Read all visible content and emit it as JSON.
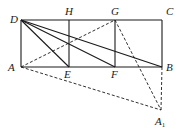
{
  "diagram": {
    "type": "geometry",
    "points": [
      {
        "id": "D",
        "label": "D"
      },
      {
        "id": "H",
        "label": "H"
      },
      {
        "id": "G",
        "label": "G"
      },
      {
        "id": "C",
        "label": "C"
      },
      {
        "id": "A",
        "label": "A"
      },
      {
        "id": "E",
        "label": "E"
      },
      {
        "id": "F",
        "label": "F"
      },
      {
        "id": "B",
        "label": "B"
      },
      {
        "id": "A1",
        "label": "A",
        "subscript": "1"
      }
    ],
    "solid_segments": [
      [
        "D",
        "C"
      ],
      [
        "A",
        "B"
      ],
      [
        "D",
        "A"
      ],
      [
        "C",
        "B"
      ],
      [
        "H",
        "E"
      ],
      [
        "G",
        "F"
      ],
      [
        "D",
        "E"
      ],
      [
        "D",
        "F"
      ],
      [
        "D",
        "B"
      ]
    ],
    "dashed_segments": [
      [
        "A",
        "G"
      ],
      [
        "A",
        "A1"
      ],
      [
        "G",
        "A1"
      ],
      [
        "B",
        "A1"
      ]
    ]
  }
}
